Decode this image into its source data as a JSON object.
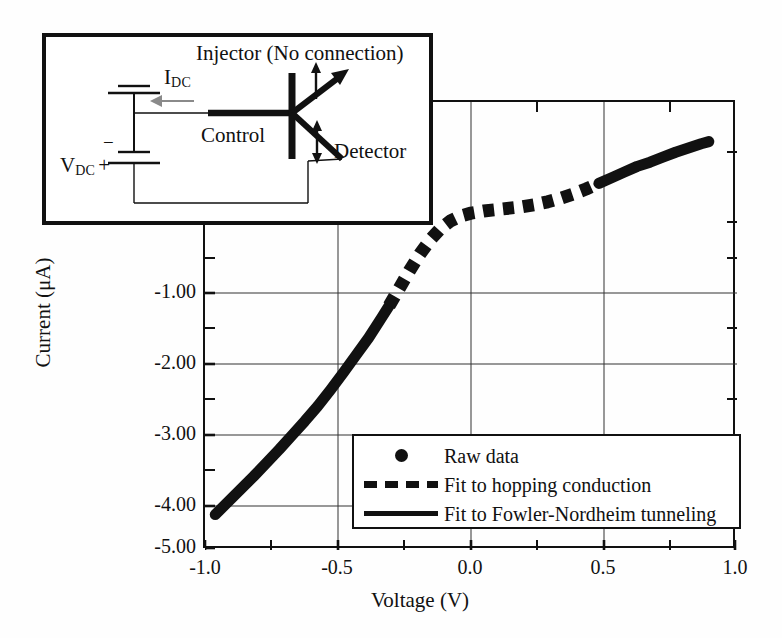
{
  "figure": {
    "background": "#fefefe",
    "ink_color": "#111111"
  },
  "axes": {
    "xlabel": "Voltage (V)",
    "ylabel": "Current (μA)",
    "xticks": [
      "-1.0",
      "-0.5",
      "0.0",
      "0.5",
      "1.0"
    ],
    "yticks": [
      "-1.00",
      "-2.00",
      "-3.00",
      "-4.00",
      "-5.00"
    ]
  },
  "legend": {
    "items": [
      {
        "key": "dot-marker",
        "label": "Raw data"
      },
      {
        "key": "dashed-line",
        "label": "Fit to hopping conduction"
      },
      {
        "key": "solid-line",
        "label": "Fit to Fowler-Nordheim tunneling"
      }
    ]
  },
  "inset": {
    "title": "Injector (No connection)",
    "current_source": "I",
    "current_source_sub": "DC",
    "voltage_source": "V",
    "voltage_source_sub": "DC",
    "voltage_plus": "+",
    "voltage_minus": "−",
    "control_label": "Control",
    "detector_label": "Detector"
  },
  "chart_data": {
    "type": "line",
    "title": "",
    "xlabel": "Voltage (V)",
    "ylabel": "Current (μA)",
    "xlim": [
      -1.04,
      1.04
    ],
    "ylim": [
      -5.0,
      1.33
    ],
    "grid": true,
    "x_major_gridlines": [
      -0.5,
      0.0,
      0.5
    ],
    "y_major_gridlines": [
      -1.0,
      -2.0,
      -3.0,
      -4.0
    ],
    "x_minor_ticks": [
      -0.75,
      -0.25,
      0.25,
      0.75
    ],
    "y_minor_ticks": [
      -0.5,
      -1.5,
      -2.5,
      -3.5,
      -4.5,
      0.5,
      1.0
    ],
    "legend_position": "lower right",
    "series": [
      {
        "name": "Raw data / Fit to Fowler-Nordheim tunneling (left branch)",
        "style": "solid",
        "x": [
          -1.0,
          -0.95,
          -0.9,
          -0.85,
          -0.8,
          -0.75,
          -0.7,
          -0.65,
          -0.6,
          -0.55,
          -0.5,
          -0.45,
          -0.4,
          -0.35,
          -0.32
        ],
        "y": [
          -4.5,
          -4.32,
          -4.14,
          -3.96,
          -3.77,
          -3.58,
          -3.38,
          -3.18,
          -2.97,
          -2.74,
          -2.5,
          -2.25,
          -2.0,
          -1.72,
          -1.55
        ]
      },
      {
        "name": "Fit to hopping conduction",
        "style": "dashed",
        "x": [
          -0.32,
          -0.28,
          -0.24,
          -0.2,
          -0.16,
          -0.12,
          -0.08,
          -0.04,
          0.0,
          0.05,
          0.1,
          0.15,
          0.2,
          0.25,
          0.3,
          0.35,
          0.4,
          0.45,
          0.5
        ],
        "y": [
          -1.55,
          -1.3,
          -1.05,
          -0.82,
          -0.62,
          -0.46,
          -0.35,
          -0.28,
          -0.24,
          -0.21,
          -0.19,
          -0.17,
          -0.15,
          -0.12,
          -0.08,
          -0.03,
          0.03,
          0.1,
          0.18
        ]
      },
      {
        "name": "Fit to Fowler-Nordheim tunneling (right branch)",
        "style": "solid",
        "x": [
          0.5,
          0.55,
          0.6,
          0.65,
          0.7,
          0.75,
          0.8,
          0.85,
          0.9,
          0.93
        ],
        "y": [
          0.18,
          0.26,
          0.34,
          0.42,
          0.48,
          0.55,
          0.62,
          0.68,
          0.74,
          0.77
        ]
      }
    ]
  }
}
